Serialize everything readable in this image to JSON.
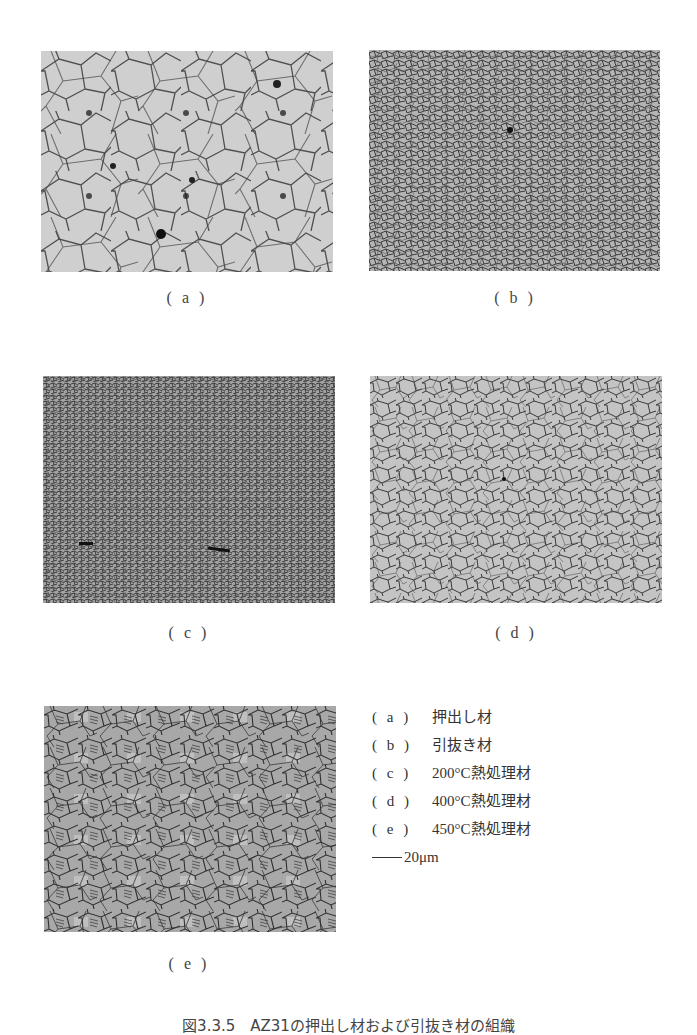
{
  "figure": {
    "caption": "図3.3.5　AZ31の押出し材および引抜き材の組織",
    "panels": [
      {
        "id": "a",
        "label": "( a )",
        "description": "押出し材"
      },
      {
        "id": "b",
        "label": "( b )",
        "description": "引抜き材"
      },
      {
        "id": "c",
        "label": "( c )",
        "description": "200°C熱処理材"
      },
      {
        "id": "d",
        "label": "( d )",
        "description": "400°C熱処理材"
      },
      {
        "id": "e",
        "label": "( e )",
        "description": "450°C熱処理材"
      }
    ],
    "legend": [
      {
        "key": "( a )",
        "text": "押出し材"
      },
      {
        "key": "( b )",
        "text": "引抜き材"
      },
      {
        "key": "( c )",
        "text": "200°C熱処理材"
      },
      {
        "key": "( d )",
        "text": "400°C熱処理材"
      },
      {
        "key": "( e )",
        "text": "450°C熱処理材"
      }
    ],
    "scale_bar": {
      "value": "20μm"
    },
    "colors": {
      "panel_a_bg": "#cfcfcf",
      "panel_b_bg": "#9a9a9a",
      "panel_c_bg": "#8c8c8c",
      "panel_d_bg": "#c4c4c4",
      "panel_e_bg": "#a8a8a8",
      "boundary": "#3a3a3a"
    }
  }
}
